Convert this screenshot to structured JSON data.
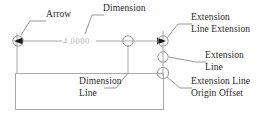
{
  "diagram": {
    "dimension_value": "4.0000",
    "colors": {
      "geometry_line": "#a9a9a9",
      "leader_line": "#8c8c8c",
      "marker_stroke": "#9a9a9a",
      "arrow_fill": "#1a1a1a",
      "label_text": "#2a2a2a",
      "dimension_text": "#b9b9b9",
      "background": "#ffffff"
    },
    "labels": {
      "arrow": "Arrow",
      "dimension": "Dimension",
      "extension_line_extension_1": "Extension",
      "extension_line_extension_2": "Line Extension",
      "extension_line_1": "Extension",
      "extension_line_2": "Line",
      "extension_line_origin_offset_1": "Extension Line",
      "extension_line_origin_offset_2": "Origin Offset",
      "dimension_line_1": "Dimension",
      "dimension_line_2": "Line"
    }
  }
}
